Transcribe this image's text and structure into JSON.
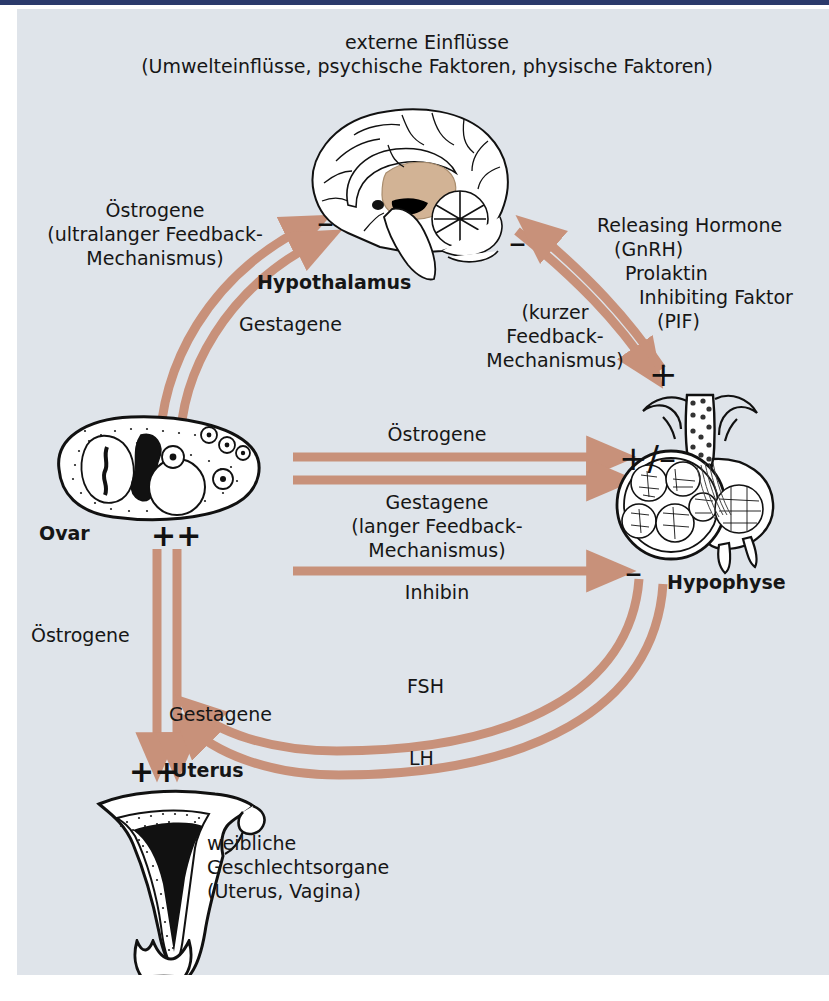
{
  "figure": {
    "background_color": "#dfe4ea",
    "arrow_color": "#c8917a",
    "top_rule_color": "#2b3a6b",
    "text_color": "#161616"
  },
  "labels": {
    "external_influences_line1": "externe Einflüsse",
    "external_influences_line2": "(Umwelteinflüsse, psychische Faktoren, physische Faktoren)",
    "oestrogene_ultralang_line1": "Östrogene",
    "oestrogene_ultralang_line2": "(ultralanger Feedback-",
    "oestrogene_ultralang_line3": "Mechanismus)",
    "gestagene_hypothalamus": "Gestagene",
    "hypothalamus": "Hypothalamus",
    "releasing_hormone_line1": "Releasing Hormone",
    "releasing_hormone_line2": "(GnRH)",
    "prolaktin_line1": "Prolaktin",
    "prolaktin_line2": "Inhibiting Faktor",
    "prolaktin_line3": "(PIF)",
    "kurzer_feedback_line1": "(kurzer",
    "kurzer_feedback_line2": "Feedback-",
    "kurzer_feedback_line3": "Mechanismus)",
    "oestrogene_center": "Östrogene",
    "gestagene_langer_line1": "Gestagene",
    "gestagene_langer_line2": "(langer Feedback-",
    "gestagene_langer_line3": "Mechanismus)",
    "inhibin": "Inhibin",
    "ovar": "Ovar",
    "hypophyse": "Hypophyse",
    "oestrogene_uterus": "Östrogene",
    "gestagene_uterus": "Gestagene",
    "fsh": "FSH",
    "lh": "LH",
    "uterus": "Uterus",
    "female_organs_line1": "weibliche",
    "female_organs_line2": "Geschlechtsorgane",
    "female_organs_line3": "(Uterus, Vagina)"
  },
  "signs": {
    "minus_hypothalamus_left": "–",
    "minus_hypothalamus_right": "–",
    "plus_hypophyse": "+",
    "plus_minus_hypophyse": "+/–",
    "minus_inhibin": "–",
    "plus_plus_ovar": "++",
    "plus_plus_uterus": "++"
  },
  "organs": {
    "brain": "brain-sagittal-illustration",
    "ovary": "ovary-illustration",
    "pituitary": "pituitary-illustration",
    "uterus": "uterus-illustration"
  }
}
